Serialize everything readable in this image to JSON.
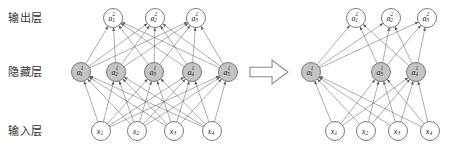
{
  "figure": {
    "background_color": "#ffffff",
    "node_gray_color": "#c4c4c4",
    "node_white_color": "#ffffff",
    "edge_color": "#5a5a5a",
    "node_stroke_color": "#6b6b6b"
  },
  "labels": {
    "output_layer": "输出层",
    "hidden_layer": "隐藏层",
    "input_layer": "输入层"
  },
  "transition": {
    "icon": "right-arrow-icon",
    "symbol": "⇒"
  },
  "left_network": {
    "name": "full-network",
    "output_layer": {
      "nodes": [
        {
          "base": "a",
          "sub": "1",
          "sup": "2",
          "fill": "white"
        },
        {
          "base": "a",
          "sub": "2",
          "sup": "2",
          "fill": "white"
        },
        {
          "base": "a",
          "sub": "3",
          "sup": "2",
          "fill": "white"
        }
      ]
    },
    "hidden_layer": {
      "nodes": [
        {
          "base": "a",
          "sub": "1",
          "sup": "1",
          "fill": "gray"
        },
        {
          "base": "a",
          "sub": "2",
          "sup": "1",
          "fill": "gray"
        },
        {
          "base": "a",
          "sub": "3",
          "sup": "1",
          "fill": "gray"
        },
        {
          "base": "a",
          "sub": "4",
          "sup": "1",
          "fill": "gray"
        },
        {
          "base": "a",
          "sub": "5",
          "sup": "1",
          "fill": "gray"
        }
      ]
    },
    "input_layer": {
      "nodes": [
        {
          "base": "x",
          "sub": "1",
          "sup": "",
          "fill": "white"
        },
        {
          "base": "x",
          "sub": "2",
          "sup": "",
          "fill": "white"
        },
        {
          "base": "x",
          "sub": "3",
          "sup": "",
          "fill": "white"
        },
        {
          "base": "x",
          "sub": "4",
          "sup": "",
          "fill": "white"
        }
      ]
    }
  },
  "right_network": {
    "name": "dropout-network",
    "output_layer": {
      "nodes": [
        {
          "base": "a",
          "sub": "1",
          "sup": "2",
          "fill": "white"
        },
        {
          "base": "a",
          "sub": "2",
          "sup": "2",
          "fill": "white"
        },
        {
          "base": "a",
          "sub": "3",
          "sup": "2",
          "fill": "white"
        }
      ]
    },
    "hidden_layer": {
      "nodes": [
        {
          "base": "a",
          "sub": "1",
          "sup": "1",
          "fill": "gray"
        },
        {
          "base": "a",
          "sub": "3",
          "sup": "1",
          "fill": "gray"
        },
        {
          "base": "a",
          "sub": "4",
          "sup": "1",
          "fill": "gray"
        }
      ]
    },
    "input_layer": {
      "nodes": [
        {
          "base": "x",
          "sub": "1",
          "sup": "",
          "fill": "white"
        },
        {
          "base": "x",
          "sub": "2",
          "sup": "",
          "fill": "white"
        },
        {
          "base": "x",
          "sub": "3",
          "sup": "",
          "fill": "white"
        },
        {
          "base": "x",
          "sub": "4",
          "sup": "",
          "fill": "white"
        }
      ]
    }
  },
  "geometry": {
    "rows": {
      "output_y": 18,
      "hidden_y": 72,
      "input_y": 131
    },
    "node_radius": 9.5,
    "left": {
      "output_x": [
        113,
        155,
        196
      ],
      "hidden_x": [
        81,
        116,
        154,
        192,
        228
      ],
      "input_x": [
        101,
        137,
        174,
        212
      ]
    },
    "right": {
      "output_x": [
        356,
        391,
        427
      ],
      "hidden_x": [
        311,
        381,
        416
      ],
      "input_x": [
        335,
        366,
        398,
        430
      ]
    },
    "arrow": {
      "x": 250,
      "y": 72,
      "width": 38,
      "height": 24
    }
  }
}
